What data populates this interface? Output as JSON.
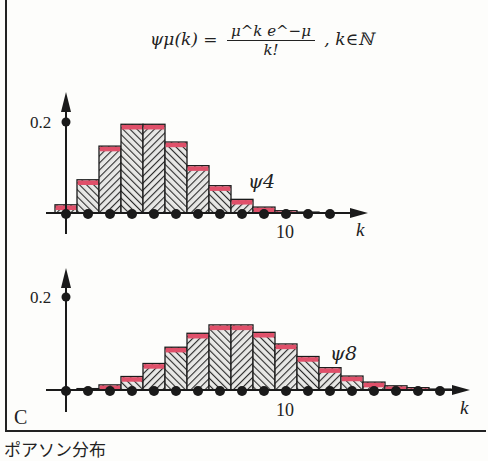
{
  "formula": {
    "lhs": "ψμ(k) =",
    "numerator": "μ^k e^−μ",
    "denominator": "k!",
    "domain": ", k∈ℕ"
  },
  "panel_label": "C",
  "caption": "ポアソン分布",
  "colors": {
    "bar_hatch": "#2a2a2a",
    "bar_top": "#e0506a",
    "axis": "#1a1a1a",
    "background": "#fdfdfb"
  },
  "chart_data": [
    {
      "type": "bar",
      "title": "ψ4",
      "series_label": "ψ4",
      "mu": 4,
      "x": [
        0,
        1,
        2,
        3,
        4,
        5,
        6,
        7,
        8,
        9,
        10,
        11,
        12
      ],
      "values": [
        0.018,
        0.073,
        0.147,
        0.195,
        0.195,
        0.156,
        0.104,
        0.06,
        0.03,
        0.013,
        0.005,
        0.002,
        0.001
      ],
      "xlabel": "k",
      "ylabel": "",
      "x_tick_labels": [
        {
          "x": 10,
          "label": "10"
        }
      ],
      "y_tick_labels": [
        {
          "y": 0.2,
          "label": "0.2"
        }
      ],
      "ylim": [
        0,
        0.25
      ],
      "xlim": [
        0,
        13
      ],
      "grid": false
    },
    {
      "type": "bar",
      "title": "ψ8",
      "series_label": "ψ8",
      "mu": 8,
      "x": [
        0,
        1,
        2,
        3,
        4,
        5,
        6,
        7,
        8,
        9,
        10,
        11,
        12,
        13,
        14,
        15,
        16,
        17
      ],
      "values": [
        0.0003,
        0.003,
        0.011,
        0.029,
        0.057,
        0.092,
        0.122,
        0.14,
        0.14,
        0.124,
        0.099,
        0.072,
        0.048,
        0.03,
        0.017,
        0.009,
        0.005,
        0.002
      ],
      "xlabel": "k",
      "ylabel": "",
      "x_tick_labels": [
        {
          "x": 10,
          "label": "10"
        }
      ],
      "y_tick_labels": [
        {
          "y": 0.2,
          "label": "0.2"
        }
      ],
      "ylim": [
        0,
        0.25
      ],
      "xlim": [
        0,
        18
      ],
      "grid": false
    }
  ]
}
